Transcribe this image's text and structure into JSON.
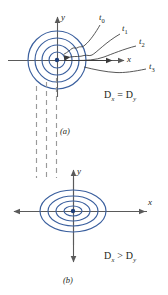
{
  "figure": {
    "colors": {
      "contour": "#3a5f9e",
      "axis": "#5a5a5a",
      "text": "#231f20",
      "dashed": "#9a9a9a",
      "center_dot": "#1f3f7a"
    },
    "panels": [
      {
        "id": "a",
        "label": "(a)",
        "condition": "D",
        "condition_sub1": "x",
        "condition_op": "=",
        "condition_d2": "D",
        "condition_sub2": "y",
        "axis_x": "x",
        "axis_y": "y",
        "shape": "circles",
        "contour_count": 4,
        "contour_radii": [
          8,
          15,
          22,
          29
        ],
        "center": [
          57,
          60
        ],
        "time_labels": [
          {
            "name": "t",
            "sub": "0",
            "x": 101,
            "y": 19
          },
          {
            "name": "t",
            "sub": "1",
            "x": 124,
            "y": 30
          },
          {
            "name": "t",
            "sub": "2",
            "x": 140,
            "y": 43
          },
          {
            "name": "t",
            "sub": "3",
            "x": 150,
            "y": 68
          }
        ]
      },
      {
        "id": "b",
        "label": "(b)",
        "condition": "D",
        "condition_sub1": "x",
        "condition_op": ">",
        "condition_d2": "D",
        "condition_sub2": "y",
        "axis_x": "x",
        "axis_y": "y",
        "shape": "ellipses",
        "contour_count": 4,
        "contour_radii_x": [
          9,
          17,
          25,
          33
        ],
        "contour_radii_y": [
          5,
          10,
          15,
          21
        ],
        "center": [
          73,
          211
        ]
      }
    ],
    "dashed_guides": {
      "count": 3,
      "x_positions": [
        36,
        46,
        56
      ],
      "y_start": 86,
      "y_end": 178
    }
  }
}
